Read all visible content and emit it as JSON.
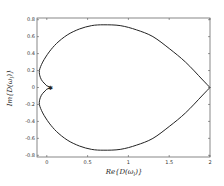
{
  "chart_data": {
    "type": "line",
    "title": "",
    "xlabel": "Re{D(ω_l)}",
    "ylabel": "Im{D(ω_l)}",
    "xlim": [
      -0.12,
      2.0
    ],
    "ylim": [
      -0.82,
      0.82
    ],
    "xticks": [
      "0",
      "0.5",
      "1",
      "1.5",
      "2"
    ],
    "xtick_values": [
      0,
      0.5,
      1,
      1.5,
      2
    ],
    "yticks": [
      "0.8",
      "0.6",
      "0.4",
      "0.2",
      "0",
      "-0.2",
      "-0.4",
      "-0.6",
      "-0.8"
    ],
    "ytick_values": [
      0.8,
      0.6,
      0.4,
      0.2,
      0,
      -0.2,
      -0.4,
      -0.6,
      -0.8
    ],
    "grid": false,
    "legend": null,
    "series": [
      {
        "name": "D(ω_l) locus",
        "color": "#222222",
        "x": [
          2.0,
          1.9,
          1.7,
          1.5,
          1.3,
          1.1,
          0.9,
          0.7,
          0.55,
          0.4,
          0.25,
          0.12,
          0.03,
          -0.05,
          -0.09,
          -0.08,
          -0.05,
          -0.02,
          0.0,
          0.03,
          0.05,
          0.03,
          0.0,
          -0.02,
          -0.05,
          -0.08,
          -0.09,
          -0.05,
          0.03,
          0.12,
          0.25,
          0.4,
          0.55,
          0.7,
          0.9,
          1.1,
          1.3,
          1.5,
          1.7,
          1.9,
          2.0
        ],
        "y": [
          0.0,
          0.1,
          0.3,
          0.46,
          0.6,
          0.68,
          0.73,
          0.74,
          0.73,
          0.69,
          0.62,
          0.52,
          0.42,
          0.3,
          0.2,
          0.12,
          0.07,
          0.04,
          0.02,
          0.01,
          0.0,
          -0.01,
          -0.02,
          -0.04,
          -0.07,
          -0.12,
          -0.2,
          -0.3,
          -0.42,
          -0.52,
          -0.62,
          -0.69,
          -0.73,
          -0.74,
          -0.73,
          -0.68,
          -0.6,
          -0.46,
          -0.3,
          -0.1,
          0.0
        ]
      }
    ],
    "markers": [
      {
        "x": 0.03,
        "y": 0.0,
        "shape": "star"
      }
    ]
  },
  "axes": {
    "xlabel_text": "Re{D(ωl)}",
    "ylabel_text": "Im{D(ωl)}"
  }
}
